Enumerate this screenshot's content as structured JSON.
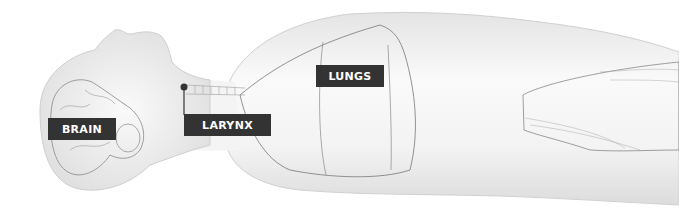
{
  "diagram": {
    "labels": [
      {
        "id": "brain",
        "text": "BRAIN"
      },
      {
        "id": "larynx",
        "text": "LARYNX"
      },
      {
        "id": "lungs",
        "text": "LUNGS"
      }
    ],
    "colors": {
      "label_background": "#333333",
      "label_text": "#ffffff",
      "body_fill": "#f2f2f2",
      "outline": "#555555"
    }
  }
}
